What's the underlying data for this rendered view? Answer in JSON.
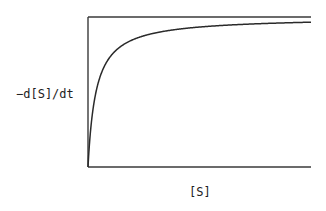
{
  "chart_data": {
    "type": "line",
    "title": "",
    "xlabel": "[S]",
    "ylabel": "−d[S]/dt",
    "x_ticks": [],
    "y_ticks": [],
    "grid": false,
    "legend": null,
    "frame": {
      "top": true,
      "left": true,
      "bottom": true,
      "right": false
    },
    "model": {
      "form": "michaelis-menten",
      "equation": "v = Vmax*[S]/(Km+[S])",
      "Vmax": 150,
      "Km": 8
    },
    "xlim": [
      0,
      223
    ],
    "ylim": [
      0,
      150
    ],
    "series": [
      {
        "name": "rate",
        "x": [
          0,
          2,
          5,
          9,
          15,
          22,
          30,
          39,
          50,
          72,
          112,
          150,
          179,
          223
        ],
        "y": [
          0,
          30,
          58,
          79,
          98,
          110,
          118,
          124,
          129,
          135,
          140,
          142,
          144,
          145
        ]
      }
    ],
    "colors": {
      "line": "#2a2a2a",
      "axes": "#3a3a3a",
      "background": "#ffffff"
    }
  },
  "labels": {
    "x": "[S]",
    "y": "−d[S]/dt"
  }
}
